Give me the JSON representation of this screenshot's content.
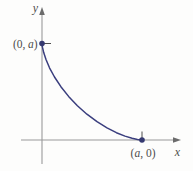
{
  "colors": {
    "background": "#fdfdfc",
    "curve": "#3a3e7e",
    "point": "#353970",
    "axis": "#9a9a9a",
    "arrow": "#6b6b6b",
    "tick": "#4d4d4d",
    "label": "#4d4d4d"
  },
  "figure": {
    "type": "math-graph",
    "axes": {
      "x_label": "x",
      "y_label": "y"
    },
    "labels": {
      "y_intercept": {
        "open": "(0,",
        "variable": "a",
        "close": ")"
      },
      "x_intercept": {
        "open": "(",
        "variable": "a",
        "close": ", 0)"
      }
    }
  }
}
